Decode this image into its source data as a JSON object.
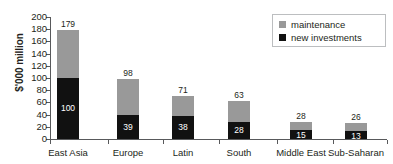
{
  "chart_data": {
    "type": "bar",
    "stacked": true,
    "title": "",
    "xlabel": "",
    "ylabel": "$'000 million",
    "ylim": [
      0,
      200
    ],
    "ytick_step": 20,
    "yticks": [
      200,
      180,
      160,
      140,
      120,
      100,
      80,
      60,
      40,
      20,
      0
    ],
    "grid": false,
    "legend_position": "top-right",
    "categories": [
      "East Asia",
      "Europe",
      "Latin",
      "South",
      "Middle East",
      "Sub-Saharan"
    ],
    "series": [
      {
        "name": "new investments",
        "color": "#111111",
        "values": [
          100,
          39,
          38,
          28,
          15,
          13
        ]
      },
      {
        "name": "maintenance",
        "color": "#999999",
        "values": [
          79,
          59,
          33,
          35,
          13,
          13
        ]
      }
    ],
    "totals": [
      179,
      98,
      71,
      63,
      28,
      26
    ],
    "total_labels": [
      "179",
      "98",
      "71",
      "63",
      "28",
      "26"
    ],
    "inner_labels": [
      "100",
      "39",
      "38",
      "28",
      "15",
      "13"
    ]
  },
  "legend": {
    "items": [
      {
        "label": "maintenance",
        "color": "#999999"
      },
      {
        "label": "new investments",
        "color": "#111111"
      }
    ]
  },
  "axis": {
    "y_title": "$'000 million",
    "y_labels": [
      "200",
      "180",
      "160",
      "140",
      "120",
      "100",
      "80",
      "60",
      "40",
      "20",
      "0"
    ],
    "x_labels": [
      "East Asia",
      "Europe",
      "Latin",
      "South",
      "Middle East",
      "Sub-Saharan"
    ]
  }
}
